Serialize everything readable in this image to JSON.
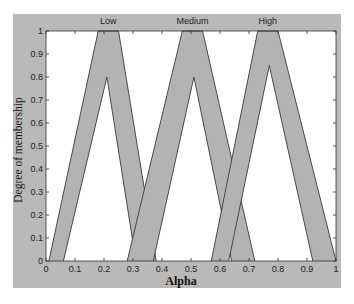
{
  "colors": {
    "frame": "#b9b9b9",
    "plot_bg": "#ffffff",
    "fou_fill": "#b3b3b3",
    "line": "#3a3a3a",
    "page_bg": "#ffffff"
  },
  "chart_data": {
    "type": "area",
    "title": "",
    "xlabel": "Alpha",
    "ylabel": "Degree of membership",
    "xlim": [
      0,
      1
    ],
    "ylim": [
      0,
      1
    ],
    "grid": false,
    "x_ticks": [
      "0",
      "0.1",
      "0.2",
      "0.3",
      "0.4",
      "0.5",
      "0.6",
      "0.7",
      "0.8",
      "0.9",
      "1"
    ],
    "y_ticks": [
      "0",
      "0.1",
      "0.2",
      "0.3",
      "0.4",
      "0.5",
      "0.6",
      "0.7",
      "0.8",
      "0.9",
      "1"
    ],
    "legend_position": "top (labels above each membership function)",
    "series": [
      {
        "name": "Low",
        "kind": "interval type-2 triangular MF (footprint of uncertainty shaded)",
        "upper_mf": {
          "x": [
            0.01,
            0.18,
            0.25,
            0.38
          ],
          "y": [
            0,
            1,
            1,
            0
          ]
        },
        "lower_mf": {
          "x": [
            0.06,
            0.21,
            0.31
          ],
          "y": [
            0,
            0.8,
            0
          ]
        }
      },
      {
        "name": "Medium",
        "kind": "interval type-2 triangular MF (footprint of uncertainty shaded)",
        "upper_mf": {
          "x": [
            0.28,
            0.47,
            0.54,
            0.72
          ],
          "y": [
            0,
            1,
            1,
            0
          ]
        },
        "lower_mf": {
          "x": [
            0.37,
            0.51,
            0.64
          ],
          "y": [
            0,
            0.8,
            0
          ]
        }
      },
      {
        "name": "High",
        "kind": "interval type-2 triangular MF (footprint of uncertainty shaded)",
        "upper_mf": {
          "x": [
            0.57,
            0.73,
            0.8,
            1.0
          ],
          "y": [
            0,
            1,
            1,
            0
          ]
        },
        "lower_mf": {
          "x": [
            0.63,
            0.77,
            0.92
          ],
          "y": [
            0,
            0.85,
            0
          ]
        }
      }
    ]
  }
}
